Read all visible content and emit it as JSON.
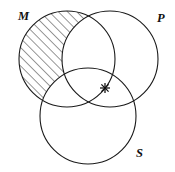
{
  "figure": {
    "type": "venn-diagram",
    "background_color": "#ffffff",
    "stroke_color": "#1a1a1a",
    "hatch_color": "#1a1a1a",
    "width": 175,
    "height": 172
  },
  "sets": [
    {
      "id": "M",
      "label": "M",
      "center_x": 67,
      "center_y": 59,
      "radius": 48,
      "label_x": 18,
      "label_y": 20,
      "shaded": true
    },
    {
      "id": "P",
      "label": "P",
      "center_x": 110,
      "center_y": 59,
      "radius": 48,
      "label_x": 157,
      "label_y": 22,
      "shaded": false
    },
    {
      "id": "S",
      "label": "S",
      "center_x": 88,
      "center_y": 116,
      "radius": 48,
      "label_x": 136,
      "label_y": 157,
      "shaded": false
    }
  ],
  "shading": {
    "region": "M only (M minus P minus S)",
    "pattern": "diagonal-hatch",
    "hatch_angle_deg": 45,
    "hatch_spacing_px": 6.5,
    "hatch_line_width": 0.9,
    "color": "#1a1a1a"
  },
  "marks": [
    {
      "id": "x-point",
      "glyph": "asterisk",
      "x": 105,
      "y": 88,
      "region": "P and S, not M",
      "size": 10
    }
  ]
}
